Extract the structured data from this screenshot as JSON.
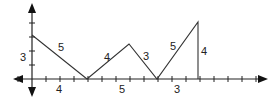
{
  "diagram": {
    "type": "coordinate-path-diagram",
    "axes": {
      "origin_px": [
        32,
        79
      ],
      "tick_spacing_px": 14,
      "x_ticks": 16,
      "y_ticks_up": 3
    },
    "path_points": [
      [
        32,
        35
      ],
      [
        87,
        79
      ],
      [
        129,
        44
      ],
      [
        157,
        79
      ],
      [
        198,
        22
      ],
      [
        198,
        79
      ]
    ],
    "segment_labels": [
      {
        "text": "5",
        "x": 58,
        "y": 51
      },
      {
        "text": "4",
        "x": 104,
        "y": 61
      },
      {
        "text": "3",
        "x": 143,
        "y": 60
      },
      {
        "text": "5",
        "x": 170,
        "y": 50
      },
      {
        "text": "4",
        "x": 201,
        "y": 55
      }
    ],
    "axis_labels": [
      {
        "text": "3",
        "x": 20,
        "y": 61
      },
      {
        "text": "4",
        "x": 56,
        "y": 93
      },
      {
        "text": "5",
        "x": 119,
        "y": 93
      },
      {
        "text": "3",
        "x": 174,
        "y": 93
      }
    ],
    "colors": {
      "line": "#333333",
      "axis": "#222222",
      "label": "#222222"
    }
  }
}
